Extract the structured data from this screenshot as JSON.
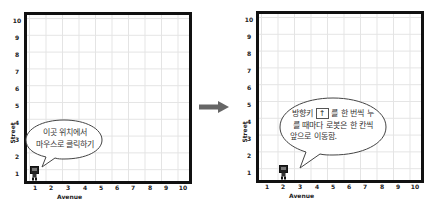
{
  "panels": [
    {
      "id": "before",
      "x_axis_label": "Avenue",
      "y_axis_label": "Street",
      "x_ticks": [
        "1",
        "2",
        "3",
        "4",
        "5",
        "6",
        "7",
        "8",
        "9",
        "10"
      ],
      "y_ticks": [
        "10",
        "9",
        "8",
        "7",
        "6",
        "5",
        "4",
        "3",
        "2",
        "1"
      ],
      "robot": {
        "avenue": 1,
        "street": 1
      },
      "bubble": {
        "line1": "이곳 위치에서",
        "line2": "마우스로 클릭하기"
      }
    },
    {
      "id": "after",
      "x_axis_label": "Avenue",
      "y_axis_label": "Street",
      "x_ticks": [
        "1",
        "2",
        "3",
        "4",
        "5",
        "6",
        "7",
        "8",
        "9",
        "10"
      ],
      "y_ticks": [
        "10",
        "9",
        "8",
        "7",
        "6",
        "5",
        "4",
        "3",
        "2",
        "1"
      ],
      "robot": {
        "avenue": 2,
        "street": 1
      },
      "bubble": {
        "line1_pre": "방향키",
        "key": "↑",
        "line1_post": "를 한 번씩 누",
        "line2": "를 때마다 로봇은 한 칸씩",
        "line3": "앞으로 이동함."
      }
    }
  ],
  "transition_arrow": {
    "icon": "right-arrow-icon",
    "color": "#666666"
  },
  "colors": {
    "border": "#111111",
    "grid": "#e4e4e4",
    "robot": "#222222",
    "arrow": "#666666"
  }
}
